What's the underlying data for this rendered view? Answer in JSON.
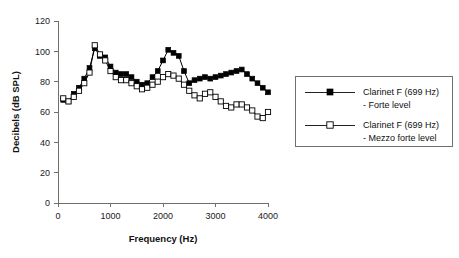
{
  "chart_data": {
    "type": "line",
    "title": "",
    "xlabel": "Frequency (Hz)",
    "ylabel": "Decibels (dB SPL)",
    "xlim": [
      0,
      4000
    ],
    "ylim": [
      0,
      120
    ],
    "xticks": [
      0,
      1000,
      2000,
      3000,
      4000
    ],
    "yticks": [
      0,
      20,
      40,
      60,
      80,
      100,
      120
    ],
    "grid": false,
    "legend_position": "right",
    "marker_shapes": [
      "filled-square",
      "open-square"
    ],
    "line_color": "#000000",
    "series": [
      {
        "name": "Clarinet F (699 Hz) - Forte level",
        "marker": "filled-square",
        "x": [
          100,
          200,
          300,
          400,
          500,
          600,
          700,
          800,
          900,
          1000,
          1100,
          1200,
          1300,
          1400,
          1500,
          1600,
          1700,
          1800,
          1900,
          2000,
          2100,
          2200,
          2300,
          2400,
          2500,
          2600,
          2700,
          2800,
          2900,
          3000,
          3100,
          3200,
          3300,
          3400,
          3500,
          3600,
          3700,
          3800,
          3900,
          4000
        ],
        "values": [
          68,
          67,
          72,
          76,
          82,
          89,
          102,
          97,
          96,
          90,
          86,
          85,
          85,
          83,
          80,
          78,
          79,
          83,
          87,
          94,
          101,
          99,
          97,
          87,
          79,
          81,
          82,
          83,
          82,
          83,
          84,
          85,
          86,
          87,
          88,
          85,
          82,
          79,
          76,
          73
        ]
      },
      {
        "name": "Clarinet F (699 Hz) - Mezzo forte level",
        "marker": "open-square",
        "x": [
          100,
          200,
          300,
          400,
          500,
          600,
          700,
          800,
          900,
          1000,
          1100,
          1200,
          1300,
          1400,
          1500,
          1600,
          1700,
          1800,
          1900,
          2000,
          2100,
          2200,
          2300,
          2400,
          2500,
          2600,
          2700,
          2800,
          2900,
          3000,
          3100,
          3200,
          3300,
          3400,
          3500,
          3600,
          3700,
          3800,
          3900,
          4000
        ],
        "values": [
          69,
          67,
          70,
          74,
          79,
          86,
          104,
          98,
          94,
          87,
          83,
          81,
          81,
          79,
          77,
          75,
          76,
          78,
          80,
          83,
          85,
          84,
          82,
          78,
          74,
          71,
          69,
          72,
          73,
          70,
          67,
          64,
          63,
          65,
          65,
          63,
          61,
          57,
          56,
          60
        ]
      }
    ],
    "legend": [
      {
        "line1": "Clarinet F (699 Hz)",
        "line2": "- Forte level",
        "marker": "filled-square"
      },
      {
        "line1": "Clarinet F (699 Hz)",
        "line2": "- Mezzo forte level",
        "marker": "open-square"
      }
    ]
  }
}
